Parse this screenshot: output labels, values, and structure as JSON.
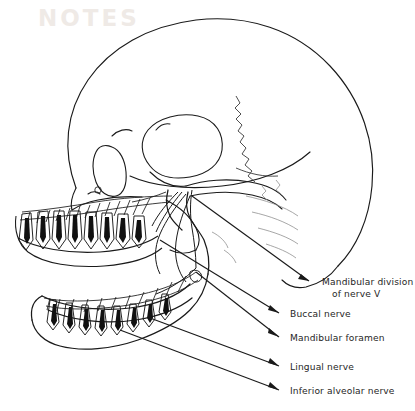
{
  "figure": {
    "ink_color": "#1a1a1a",
    "faint_ink_color": "#7b7b7b",
    "label_color": "#262626",
    "background": "#ffffff",
    "pulp_fill": "#111111"
  },
  "labels": [
    {
      "id": "mandibular-division",
      "line1": "Mandibular division",
      "line2": "of nerve V",
      "text_x": 322,
      "text_y": 285,
      "arrow_tip_x": 309,
      "arrow_tip_y": 281
    },
    {
      "id": "buccal-nerve",
      "line1": "Buccal nerve",
      "line2": "",
      "text_x": 290,
      "text_y": 317,
      "arrow_tip_x": 279,
      "arrow_tip_y": 313
    },
    {
      "id": "mandibular-foramen",
      "line1": "Mandibular foramen",
      "line2": "",
      "text_x": 290,
      "text_y": 341,
      "arrow_tip_x": 279,
      "arrow_tip_y": 337
    },
    {
      "id": "lingual-nerve",
      "line1": "Lingual nerve",
      "line2": "",
      "text_x": 290,
      "text_y": 370,
      "arrow_tip_x": 279,
      "arrow_tip_y": 366
    },
    {
      "id": "inferior-alveolar-nerve",
      "line1": "Inferior alveolar nerve",
      "line2": "",
      "text_x": 290,
      "text_y": 394,
      "arrow_tip_x": 279,
      "arrow_tip_y": 390
    }
  ],
  "ghost_text": "NOTES"
}
